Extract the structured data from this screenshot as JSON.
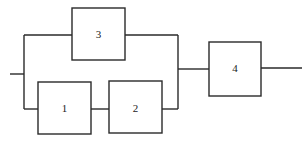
{
  "diagram": {
    "type": "reliability-block-diagram",
    "blocks": [
      {
        "id": "3",
        "label": "3"
      },
      {
        "id": "1",
        "label": "1"
      },
      {
        "id": "2",
        "label": "2"
      },
      {
        "id": "4",
        "label": "4"
      }
    ],
    "structure": "((1 series 2) parallel 3) series 4",
    "colors": {
      "line": "#2a2a2a",
      "background": "#ffffff"
    }
  }
}
